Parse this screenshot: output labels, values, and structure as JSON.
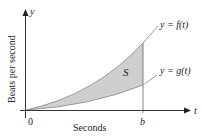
{
  "diagram": {
    "axes": {
      "y_axis_label": "y",
      "x_axis_label": "t",
      "y_title": "Beats per second",
      "x_title": "Seconds",
      "origin_label": "0",
      "b_label": "b"
    },
    "curves": {
      "upper": {
        "label": "y = f(t)",
        "color": "#b0b0b0"
      },
      "lower": {
        "label": "y = g(t)",
        "color": "#b0b0b0"
      }
    },
    "region": {
      "label": "S",
      "fill": "#cfcfcf"
    },
    "colors": {
      "axis": "#333333",
      "text": "#222222"
    }
  }
}
